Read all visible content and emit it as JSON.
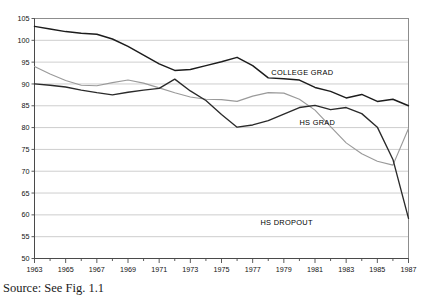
{
  "source_note": "Source: See Fig. 1.1",
  "chart_data": {
    "type": "line",
    "title": "",
    "xlabel": "",
    "ylabel": "",
    "xlim": [
      1963,
      1987
    ],
    "ylim": [
      50,
      105
    ],
    "grid": true,
    "legend_position": "inline-labels",
    "y_ticks": [
      50,
      55,
      60,
      65,
      70,
      75,
      80,
      85,
      90,
      95,
      100,
      105
    ],
    "x_ticks": [
      1963,
      1965,
      1967,
      1969,
      1971,
      1973,
      1975,
      1977,
      1979,
      1981,
      1983,
      1985,
      1987
    ],
    "x_minor_ticks": [
      1964,
      1966,
      1968,
      1970,
      1972,
      1974,
      1976,
      1978,
      1980,
      1982,
      1984,
      1986
    ],
    "x": [
      1963,
      1964,
      1965,
      1966,
      1967,
      1968,
      1969,
      1970,
      1971,
      1972,
      1973,
      1974,
      1975,
      1976,
      1977,
      1978,
      1979,
      1980,
      1981,
      1982,
      1983,
      1984,
      1985,
      1986,
      1987
    ],
    "series": [
      {
        "name": "COLLEGE GRAD",
        "label": "COLLEGE GRAD",
        "color": "#1c1c1c",
        "label_x": 1978.2,
        "label_y": 92.0,
        "values": [
          103.2,
          102.6,
          102.0,
          101.6,
          101.4,
          100.3,
          98.6,
          96.6,
          94.6,
          93.1,
          93.3,
          94.2,
          95.1,
          96.1,
          94.2,
          91.4,
          91.2,
          90.9,
          89.2,
          88.3,
          86.8,
          87.6,
          86.0,
          86.5,
          85.9
        ],
        "end_value": 85.0
      },
      {
        "name": "HS GRAD",
        "label": "HS GRAD",
        "color": "#9a9a9a",
        "label_x": 1980.0,
        "label_y": 80.6,
        "values": [
          94.0,
          92.3,
          90.8,
          89.7,
          89.6,
          90.3,
          90.9,
          90.2,
          89.1,
          88.0,
          87.0,
          86.5,
          86.4,
          86.0,
          87.2,
          88.0,
          87.9,
          86.5,
          84.0,
          80.2,
          76.5,
          74.0,
          72.3,
          71.4,
          71.6
        ],
        "end_value": 79.8
      },
      {
        "name": "HS DROPOUT",
        "label": "HS DROPOUT",
        "color": "#1c1c1c",
        "label_x": 1977.5,
        "label_y": 57.6,
        "values": [
          90.0,
          89.7,
          89.3,
          88.6,
          88.0,
          87.5,
          88.1,
          88.6,
          89.0,
          91.1,
          88.4,
          86.2,
          83.0,
          80.1,
          80.6,
          81.6,
          83.1,
          84.6,
          85.1,
          84.1,
          84.6,
          83.2,
          80.1,
          72.7,
          66.0
        ],
        "end_value": 59.2
      }
    ],
    "series_tail": {
      "note": "values continue to 1987 endpoints"
    }
  }
}
